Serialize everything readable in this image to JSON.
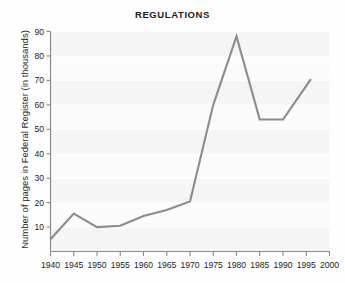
{
  "chart_data": {
    "type": "line",
    "title": "REGULATIONS",
    "xlabel": "",
    "ylabel": "Number of pages in Federal Register (in thousands)",
    "x": [
      1940,
      1945,
      1950,
      1955,
      1960,
      1965,
      1970,
      1975,
      1980,
      1985,
      1990,
      1996
    ],
    "values": [
      5,
      15.5,
      10,
      10.5,
      14.5,
      17,
      20.5,
      60,
      88,
      54,
      54,
      70.5
    ],
    "series": [
      {
        "name": "Number of pages in Federal Register (in thousands)",
        "values": [
          5,
          15.5,
          10,
          10.5,
          14.5,
          17,
          20.5,
          60,
          88,
          54,
          54,
          70.5
        ]
      }
    ],
    "xlim": [
      1940,
      2000
    ],
    "ylim": [
      0,
      90
    ],
    "x_tick_labels": [
      "1940",
      "1945",
      "1950",
      "1955",
      "1960",
      "1965",
      "1970",
      "1975",
      "1980",
      "1985",
      "1990",
      "1995",
      "2000"
    ],
    "x_tick_values": [
      1940,
      1945,
      1950,
      1955,
      1960,
      1965,
      1970,
      1975,
      1980,
      1985,
      1990,
      1995,
      2000
    ],
    "y_tick_labels": [
      "10",
      "20",
      "30",
      "40",
      "50",
      "60",
      "70",
      "80",
      "90"
    ],
    "y_tick_values": [
      10,
      20,
      30,
      40,
      50,
      60,
      70,
      80,
      90
    ],
    "grid": "horizontal-banded",
    "legend": "none",
    "line_color": "#8c8c8c",
    "plot_background": "#fbfbfb",
    "band_color": "#f1f1f1",
    "axis_color": "#8a8a8a",
    "title_color": "#1b1b1b"
  }
}
